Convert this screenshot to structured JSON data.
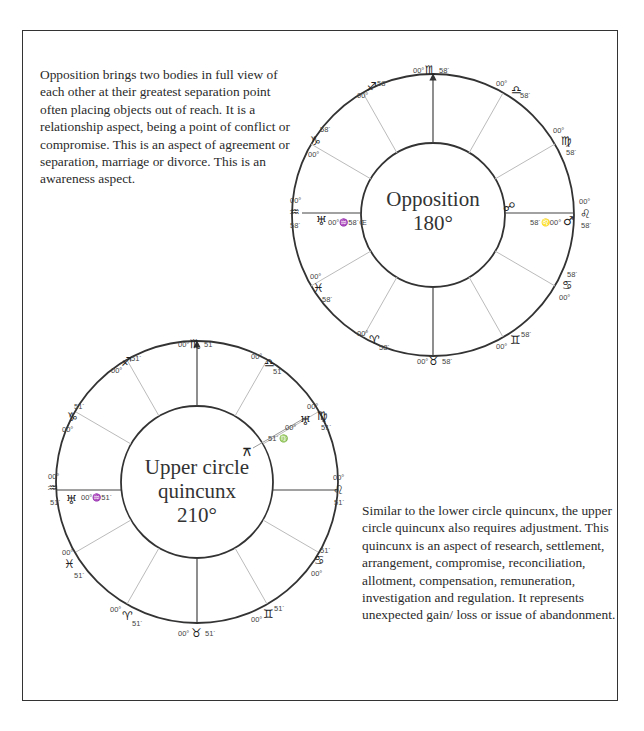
{
  "paragraphs": {
    "opposition": "Opposition brings two bodies in full view of each other at their greatest separation point often placing objects out of reach. It is a relationship aspect, being a point of conflict or compromise. This is an aspect of agreement or separation, marriage or divorce. This is an awareness aspect.",
    "quincunx": "Similar to the lower circle quincunx, the upper circle quincunx also requires adjustment. This quincunx is an aspect of research, settlement, arrangement, compromise, reconciliation, allotment, compensation, remuneration, investigation and regulation. It represents unexpected gain/ loss or issue of abandonment."
  },
  "charts": {
    "opposition": {
      "title_line1": "Opposition",
      "title_line2": "180°",
      "degree": "00°",
      "minute": "58´",
      "signs": [
        {
          "glyph": "♏",
          "name": "scorpio"
        },
        {
          "glyph": "♎",
          "name": "libra"
        },
        {
          "glyph": "♍",
          "name": "virgo"
        },
        {
          "glyph": "♌",
          "name": "leo"
        },
        {
          "glyph": "♋",
          "name": "cancer"
        },
        {
          "glyph": "♊",
          "name": "gemini"
        },
        {
          "glyph": "♉",
          "name": "taurus"
        },
        {
          "glyph": "♈",
          "name": "aries"
        },
        {
          "glyph": "♓",
          "name": "pisces"
        },
        {
          "glyph": "♒",
          "name": "aquarius"
        },
        {
          "glyph": "♑",
          "name": "capricorn"
        },
        {
          "glyph": "♐",
          "name": "sagittarius"
        }
      ],
      "aspect_glyph": "☍",
      "planet_right": {
        "glyph": "♂",
        "label": "58´♌00°"
      },
      "planet_left": {
        "glyph": "♅",
        "label": "00°♒58´Œ"
      }
    },
    "quincunx": {
      "title_line1": "Upper circle",
      "title_line2": "quincunx",
      "title_line3": "210°",
      "degree": "00°",
      "minute": "51´",
      "signs": [
        {
          "glyph": "♏",
          "name": "scorpio"
        },
        {
          "glyph": "♎",
          "name": "libra"
        },
        {
          "glyph": "♍",
          "name": "virgo"
        },
        {
          "glyph": "♌",
          "name": "leo"
        },
        {
          "glyph": "♋",
          "name": "cancer"
        },
        {
          "glyph": "♊",
          "name": "gemini"
        },
        {
          "glyph": "♉",
          "name": "taurus"
        },
        {
          "glyph": "♈",
          "name": "aries"
        },
        {
          "glyph": "♓",
          "name": "pisces"
        },
        {
          "glyph": "♒",
          "name": "aquarius"
        },
        {
          "glyph": "♑",
          "name": "capricorn"
        },
        {
          "glyph": "♐",
          "name": "sagittarius"
        }
      ],
      "aspect_glyph": "⚻",
      "planet_upper_right": {
        "glyph": "♅",
        "label_deg": "00°",
        "label_sign": "51´♍"
      },
      "planet_left": {
        "glyph": "♅",
        "label": "00°♒51´"
      }
    }
  }
}
